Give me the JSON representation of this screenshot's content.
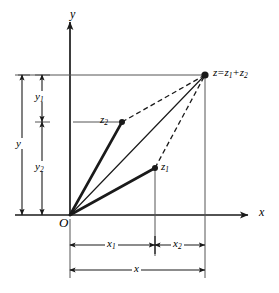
{
  "figure": {
    "background_color": "#ffffff",
    "line_color": "#1a1a1a",
    "axes": {
      "x_label": "x",
      "y_label": "y",
      "origin_label": "O"
    },
    "points": [
      {
        "id": "z1",
        "label": "z",
        "sub": "1",
        "x": 155,
        "y": 168
      },
      {
        "id": "z2",
        "label": "z",
        "sub": "2",
        "x": 122,
        "y": 122
      },
      {
        "id": "z",
        "label": "z",
        "sub": "",
        "x": 205,
        "y": 75
      }
    ],
    "sum_label": {
      "lhs": "z",
      "equals": "=",
      "term1": "z",
      "term1_sub": "1",
      "plus": "+",
      "term2": "z",
      "term2_sub": "2"
    },
    "dimensions": {
      "vertical": [
        {
          "id": "y",
          "label": "y",
          "sub": "",
          "from_y": 75,
          "to_y": 215,
          "at_x": 22
        },
        {
          "id": "y1",
          "label": "y",
          "sub": "1",
          "from_y": 75,
          "to_y": 122,
          "at_x": 42
        },
        {
          "id": "y2",
          "label": "y",
          "sub": "2",
          "from_y": 122,
          "to_y": 215,
          "at_x": 42
        }
      ],
      "horizontal": [
        {
          "id": "x1",
          "label": "x",
          "sub": "1",
          "from_x": 70,
          "to_x": 155,
          "at_y": 245
        },
        {
          "id": "x2",
          "label": "x",
          "sub": "2",
          "from_x": 155,
          "to_x": 205,
          "at_y": 245
        },
        {
          "id": "x",
          "label": "x",
          "sub": "",
          "from_x": 70,
          "to_x": 205,
          "at_y": 270
        }
      ]
    },
    "vectors": [
      {
        "id": "O-z1",
        "style": "solid",
        "from": "O",
        "to": "z1"
      },
      {
        "id": "O-z2",
        "style": "solid",
        "from": "O",
        "to": "z2"
      },
      {
        "id": "O-z",
        "style": "solid",
        "from": "O",
        "to": "z"
      },
      {
        "id": "z1-z",
        "style": "dashed",
        "from": "z1",
        "to": "z"
      },
      {
        "id": "z2-z",
        "style": "dashed",
        "from": "z2",
        "to": "z"
      }
    ]
  }
}
